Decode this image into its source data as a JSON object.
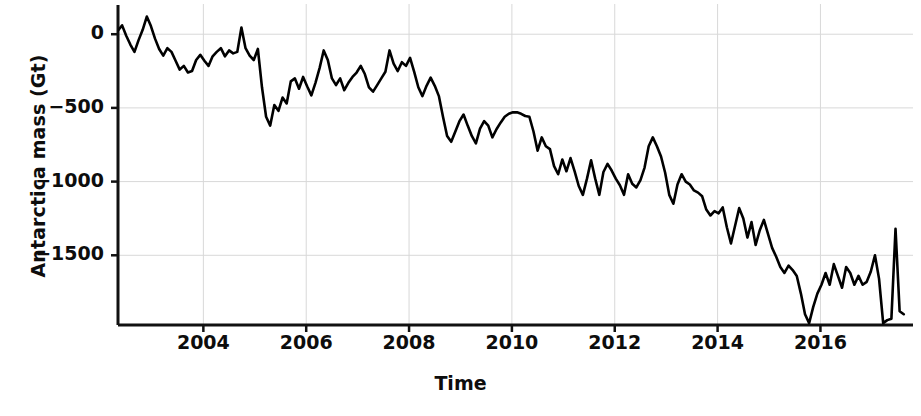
{
  "chart_data": {
    "type": "line",
    "title": "",
    "xlabel": "Time",
    "ylabel": "Antarctica mass (Gt)",
    "grid": true,
    "legend": null,
    "line_color": "#000000",
    "line_width_px": 2.6,
    "xlim": [
      2002.34,
      2017.8
    ],
    "ylim": [
      -1973,
      205
    ],
    "xticks": [
      2004,
      2006,
      2008,
      2010,
      2012,
      2014,
      2016
    ],
    "xtick_labels": [
      "2004",
      "2006",
      "2008",
      "2010",
      "2012",
      "2014",
      "2016"
    ],
    "yticks": [
      0,
      -500,
      -1000,
      -1500
    ],
    "ytick_labels": [
      "0",
      "−500",
      "−1000",
      "−1500"
    ],
    "series": [
      {
        "name": "Antarctica mass anomaly",
        "units": "Gt",
        "x": [
          2002.34,
          2002.42,
          2002.5,
          2002.58,
          2002.66,
          2002.74,
          2002.82,
          2002.9,
          2002.98,
          2003.06,
          2003.14,
          2003.22,
          2003.3,
          2003.38,
          2003.46,
          2003.54,
          2003.62,
          2003.7,
          2003.78,
          2003.86,
          2003.94,
          2004.02,
          2004.1,
          2004.18,
          2004.26,
          2004.34,
          2004.42,
          2004.5,
          2004.58,
          2004.66,
          2004.74,
          2004.82,
          2004.9,
          2004.98,
          2005.06,
          2005.14,
          2005.22,
          2005.3,
          2005.38,
          2005.46,
          2005.54,
          2005.62,
          2005.7,
          2005.78,
          2005.86,
          2005.94,
          2006.02,
          2006.1,
          2006.18,
          2006.26,
          2006.34,
          2006.42,
          2006.5,
          2006.58,
          2006.66,
          2006.74,
          2006.82,
          2006.9,
          2006.98,
          2007.06,
          2007.14,
          2007.22,
          2007.3,
          2007.38,
          2007.46,
          2007.54,
          2007.62,
          2007.7,
          2007.78,
          2007.86,
          2007.94,
          2008.02,
          2008.1,
          2008.18,
          2008.26,
          2008.34,
          2008.42,
          2008.5,
          2008.58,
          2008.66,
          2008.74,
          2008.82,
          2008.9,
          2008.98,
          2009.06,
          2009.14,
          2009.22,
          2009.3,
          2009.38,
          2009.46,
          2009.54,
          2009.62,
          2009.7,
          2009.78,
          2009.86,
          2009.94,
          2010.02,
          2010.1,
          2010.18,
          2010.26,
          2010.34,
          2010.42,
          2010.5,
          2010.58,
          2010.66,
          2010.74,
          2010.82,
          2010.9,
          2010.98,
          2011.06,
          2011.14,
          2011.22,
          2011.3,
          2011.38,
          2011.46,
          2011.54,
          2011.62,
          2011.7,
          2011.78,
          2011.86,
          2011.94,
          2012.02,
          2012.1,
          2012.18,
          2012.26,
          2012.34,
          2012.42,
          2012.5,
          2012.58,
          2012.66,
          2012.74,
          2012.82,
          2012.9,
          2012.98,
          2013.06,
          2013.14,
          2013.22,
          2013.3,
          2013.38,
          2013.46,
          2013.54,
          2013.62,
          2013.7,
          2013.78,
          2013.86,
          2013.94,
          2014.02,
          2014.1,
          2014.18,
          2014.26,
          2014.34,
          2014.42,
          2014.5,
          2014.58,
          2014.66,
          2014.74,
          2014.82,
          2014.9,
          2014.98,
          2015.06,
          2015.14,
          2015.22,
          2015.3,
          2015.38,
          2015.46,
          2015.54,
          2015.62,
          2015.7,
          2015.78,
          2015.86,
          2015.94,
          2016.02,
          2016.1,
          2016.18,
          2016.26,
          2016.34,
          2016.42,
          2016.5,
          2016.58,
          2016.66,
          2016.74,
          2016.82,
          2016.9,
          2016.98,
          2017.06,
          2017.14,
          2017.22,
          2017.3,
          2017.38,
          2017.46,
          2017.54,
          2017.62
        ],
        "y": [
          25,
          60,
          -10,
          -70,
          -120,
          -40,
          30,
          120,
          55,
          -30,
          -100,
          -145,
          -95,
          -120,
          -180,
          -240,
          -215,
          -260,
          -250,
          -175,
          -140,
          -180,
          -215,
          -150,
          -120,
          -95,
          -150,
          -110,
          -130,
          -120,
          45,
          -95,
          -145,
          -175,
          -100,
          -360,
          -560,
          -620,
          -480,
          -520,
          -430,
          -470,
          -320,
          -300,
          -370,
          -290,
          -355,
          -415,
          -330,
          -230,
          -110,
          -175,
          -300,
          -345,
          -300,
          -380,
          -330,
          -290,
          -260,
          -215,
          -270,
          -360,
          -390,
          -345,
          -300,
          -255,
          -110,
          -200,
          -250,
          -190,
          -215,
          -160,
          -255,
          -360,
          -420,
          -350,
          -295,
          -350,
          -420,
          -560,
          -690,
          -730,
          -660,
          -590,
          -545,
          -620,
          -690,
          -740,
          -640,
          -590,
          -620,
          -700,
          -645,
          -600,
          -560,
          -540,
          -530,
          -530,
          -540,
          -555,
          -560,
          -660,
          -790,
          -700,
          -760,
          -780,
          -895,
          -950,
          -850,
          -930,
          -840,
          -930,
          -1030,
          -1090,
          -980,
          -855,
          -980,
          -1090,
          -935,
          -880,
          -925,
          -980,
          -1025,
          -1090,
          -950,
          -1015,
          -1040,
          -990,
          -905,
          -760,
          -700,
          -760,
          -830,
          -940,
          -1090,
          -1150,
          -1020,
          -950,
          -1000,
          -1020,
          -1060,
          -1075,
          -1100,
          -1190,
          -1230,
          -1200,
          -1215,
          -1175,
          -1310,
          -1420,
          -1300,
          -1180,
          -1250,
          -1380,
          -1275,
          -1430,
          -1330,
          -1260,
          -1355,
          -1450,
          -1510,
          -1580,
          -1620,
          -1570,
          -1600,
          -1640,
          -1760,
          -1900,
          -1960,
          -1850,
          -1760,
          -1700,
          -1620,
          -1700,
          -1560,
          -1640,
          -1720,
          -1580,
          -1620,
          -1700,
          -1640,
          -1700,
          -1680,
          -1610,
          -1500,
          -1660,
          -1960,
          -1940,
          -1930,
          -1320,
          -1880,
          -1900
        ]
      }
    ]
  },
  "axes": {
    "ylabel_text": "Antarctica mass (Gt)",
    "xlabel_text": "Time"
  }
}
